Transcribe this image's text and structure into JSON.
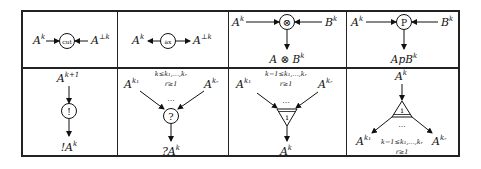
{
  "cells": {
    "cut": {
      "left": "A",
      "left_sup": "k",
      "right": "A",
      "right_sup": "⊥k",
      "node": "cut"
    },
    "ax": {
      "left": "A",
      "left_sup": "k",
      "right": "A",
      "right_sup": "⊥k",
      "node": "ax"
    },
    "tensor": {
      "left": "A",
      "left_sup": "k",
      "right": "B",
      "right_sup": "k",
      "node": "⊗",
      "out": "A ⊗ B",
      "out_sup": "k"
    },
    "par": {
      "left": "A",
      "left_sup": "k",
      "right": "B",
      "right_sup": "k",
      "node": "P",
      "out": "ApB",
      "out_sup": "k"
    },
    "ofcourse": {
      "in": "A",
      "in_sup": "k+1",
      "node": "!",
      "out": "!A",
      "out_sup": "k"
    },
    "whynot": {
      "cond1": "k≤k₁,...,kᵣ",
      "cond2": "r≥1",
      "left": "A",
      "left_sup": "k₁",
      "right": "A",
      "right_sup": "kᵣ",
      "dots": "...",
      "node": "?",
      "out": "?A",
      "out_sup": "k"
    },
    "contraction": {
      "cond1": "k−1≤k₁,...,kᵣ",
      "cond2": "r≥1",
      "left": "A",
      "left_sup": "k₁",
      "right": "A",
      "right_sup": "kᵣ",
      "dots": "...",
      "node": "i",
      "out": "A",
      "out_sup": "k"
    },
    "dual": {
      "in": "A",
      "in_sup": "k",
      "node": "i",
      "dots": "...",
      "left": "A",
      "left_sup": "k₁",
      "right": "A",
      "right_sup": "kᵣ",
      "cond1": "k−1≤k₁,...,kᵣ",
      "cond2": "r≥1"
    }
  }
}
